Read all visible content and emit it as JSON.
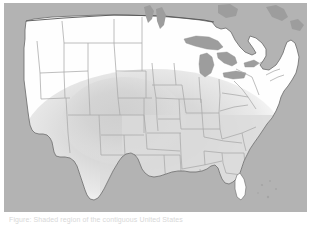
{
  "figure": {
    "kind": "thematic-choropleth-map",
    "region_depicted": "United States",
    "caption": "Figure: Shaded region of the contiguous United States",
    "colors": {
      "background_outside_country": "#b3b3b3",
      "ocean": "#b3b3b3",
      "great_lakes": "#9d9d9d",
      "state_fill_unshaded": "#fefefe",
      "state_fill_shaded": "#d9d9d9",
      "state_border": "#a8a8a8",
      "country_border": "#6f6f6f",
      "page_background": "#ffffff",
      "caption_text": "#d8d8d8"
    },
    "shaded_overlay": {
      "label": "highlighted-area",
      "shape": "soft-radial-blob",
      "center_label": "south-central United States",
      "opacity": "0.55"
    }
  },
  "map": {
    "title": "",
    "legend": [],
    "layers": [
      {
        "name": "ocean-and-foreign-landmass",
        "label": "Outside study area"
      },
      {
        "name": "great-lakes",
        "label": "Great Lakes"
      },
      {
        "name": "state-boundaries",
        "label": "State boundaries"
      },
      {
        "name": "national-boundary",
        "label": "National boundary"
      },
      {
        "name": "shaded-region",
        "label": "Shaded region"
      }
    ]
  }
}
